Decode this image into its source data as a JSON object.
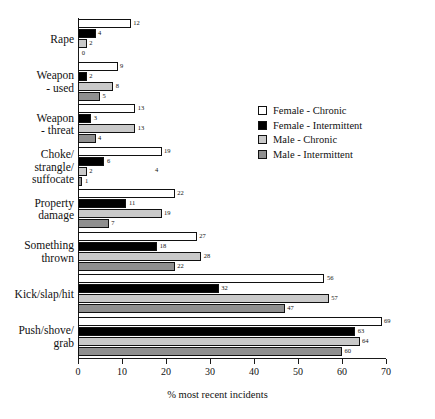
{
  "chart_data": {
    "type": "bar",
    "orientation": "horizontal",
    "title": "",
    "xlabel": "% most recent incidents",
    "ylabel": "",
    "xlim": [
      0,
      70
    ],
    "xticks": [
      0,
      10,
      20,
      30,
      40,
      50,
      60,
      70
    ],
    "grid": false,
    "legend_position": "upper-right-inside",
    "categories": [
      "Rape",
      "Weapon\n- used",
      "Weapon\n- threat",
      "Choke/\nstrangle/\nsuffocate",
      "Property\ndamage",
      "Something\nthrown",
      "Kick/slap/hit",
      "Push/shove/\ngrab"
    ],
    "series": [
      {
        "name": "Female - Chronic",
        "color": "#ffffff",
        "values": [
          12,
          9,
          13,
          19,
          22,
          27,
          56,
          69
        ]
      },
      {
        "name": "Female - Intermittent",
        "color": "#000000",
        "values": [
          4,
          2,
          3,
          6,
          11,
          18,
          32,
          63
        ]
      },
      {
        "name": "Male - Chronic",
        "color": "#c9c9c9",
        "values": [
          2,
          8,
          13,
          2,
          19,
          28,
          57,
          64
        ]
      },
      {
        "name": "Male - Intermittent",
        "color": "#8f8f8f",
        "values": [
          0,
          5,
          4,
          1,
          7,
          22,
          47,
          60
        ]
      }
    ],
    "stray_labels": [
      {
        "text": "4",
        "x_value": 17.5,
        "category_index": 3,
        "row_index": 2
      }
    ]
  }
}
